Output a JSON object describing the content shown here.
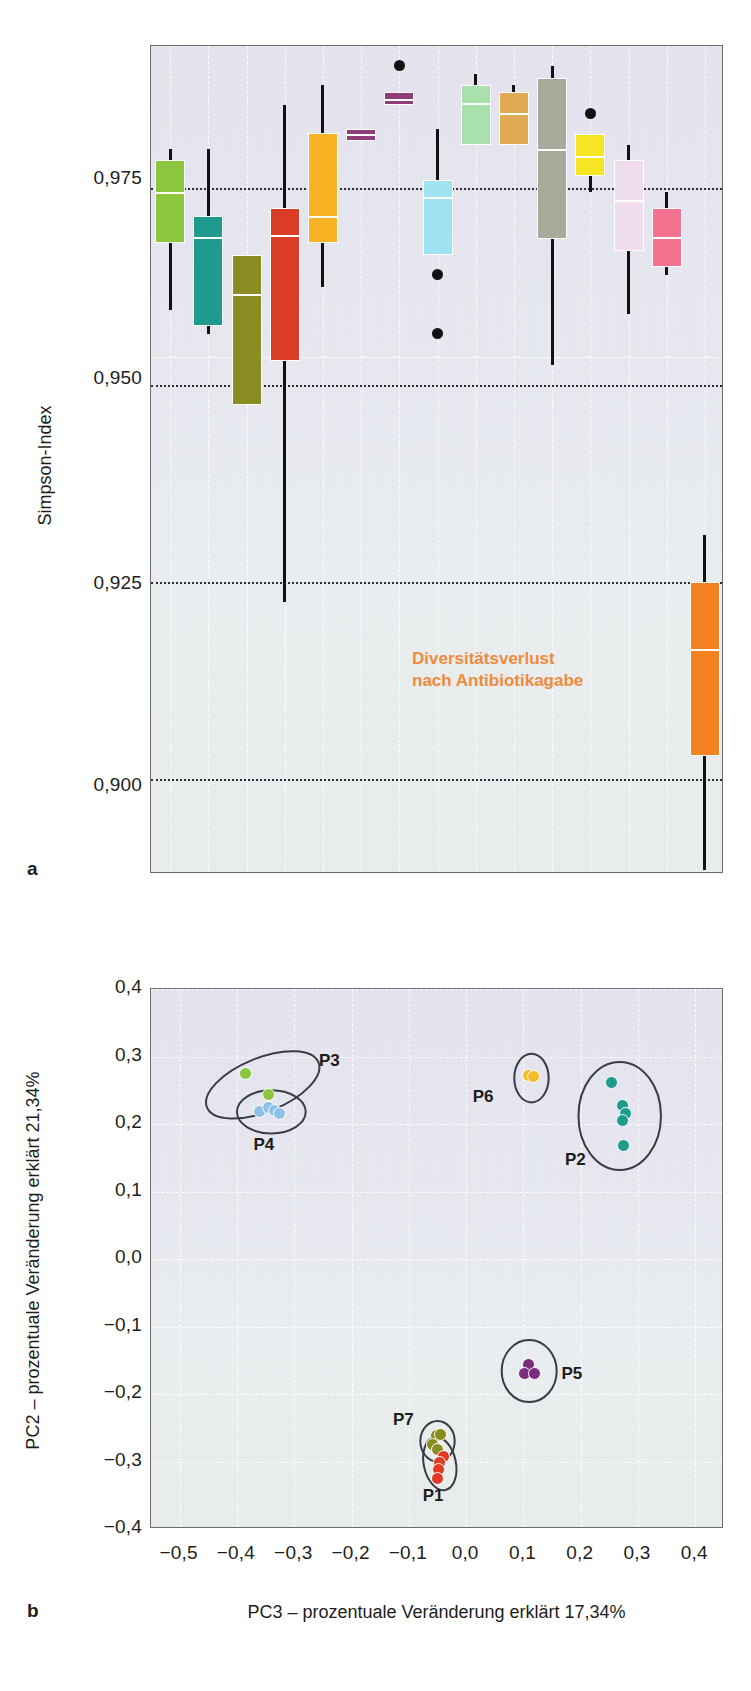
{
  "figure": {
    "panels": [
      {
        "letter": "a"
      },
      {
        "letter": "b"
      }
    ]
  },
  "panel_a": {
    "letter": "a",
    "y_axis_title": "Simpson-Index",
    "y_ticks": [
      "0,975",
      "0,950",
      "0,925",
      "0,900"
    ],
    "annotation_line1": "Diversitätsverlust",
    "annotation_line2": "nach Antibiotikagabe",
    "annotation_color": "#f08a3c"
  },
  "panel_b": {
    "letter": "b",
    "y_axis_title": "PC2 – prozentuale Veränderung erklärt 21,34%",
    "x_axis_title": "PC3 – prozentuale Veränderung erklärt 17,34%",
    "y_ticks": [
      "0,4",
      "0,3",
      "0,2",
      "0,1",
      "0,0",
      "-0,1",
      "-0,2",
      "-0,3",
      "-0,4"
    ],
    "x_ticks": [
      "-0,5",
      "-0,4",
      "-0,3",
      "-0,2",
      "-0,1",
      "0,0",
      "0,1",
      "0,2",
      "0,3",
      "0,4"
    ],
    "cluster_labels": [
      "P3",
      "P4",
      "P6",
      "P2",
      "P5",
      "P7",
      "P1"
    ]
  },
  "chart_data": [
    {
      "type": "box",
      "id": "panel-a",
      "title": "",
      "xlabel": "",
      "ylabel": "Simpson-Index",
      "ylim": [
        0.888,
        0.993
      ],
      "ytick_values": [
        0.975,
        0.95,
        0.925,
        0.9
      ],
      "ytick_labels": [
        "0,975",
        "0,950",
        "0,925",
        "0,900"
      ],
      "grid": "dotted-horizontal-at-ticks",
      "legend": "none",
      "annotations": [
        {
          "text": "Diversitätsverlust nach Antibiotikagabe",
          "color": "#f08a3c",
          "points_to": "orange-box"
        }
      ],
      "boxes": [
        {
          "name": "box-1",
          "color": "#8cc63e",
          "whisker_low": 0.9595,
          "q1": 0.968,
          "median": 0.9745,
          "q3": 0.9785,
          "whisker_high": 0.98
        },
        {
          "name": "box-2",
          "color": "#1f9a8e",
          "whisker_low": 0.9565,
          "q1": 0.9575,
          "median": 0.9688,
          "q3": 0.9715,
          "whisker_high": 0.98
        },
        {
          "name": "box-3",
          "color": "#8a8d22",
          "whisker_low": 0.9475,
          "q1": 0.9475,
          "median": 0.9615,
          "q3": 0.9665,
          "whisker_high": 0.9665
        },
        {
          "name": "box-4",
          "color": "#da3c25",
          "whisker_low": 0.9225,
          "q1": 0.953,
          "median": 0.969,
          "q3": 0.9725,
          "whisker_high": 0.9855
        },
        {
          "name": "box-5",
          "color": "#f9b325",
          "whisker_low": 0.9625,
          "q1": 0.968,
          "median": 0.9715,
          "q3": 0.982,
          "whisker_high": 0.988
        },
        {
          "name": "box-6",
          "color": "#8e3d76",
          "whisker_low": 0.981,
          "q1": 0.981,
          "median": 0.9818,
          "q3": 0.9825,
          "whisker_high": 0.9825
        },
        {
          "name": "box-7",
          "color": "#8e3d76",
          "whisker_low": 0.9855,
          "q1": 0.9855,
          "median": 0.9863,
          "q3": 0.9872,
          "whisker_high": 0.9872,
          "outlier": 0.9905
        },
        {
          "name": "box-8",
          "color": "#9fe3f2",
          "whisker_low": 0.9665,
          "q1": 0.9665,
          "median": 0.9738,
          "q3": 0.976,
          "whisker_high": 0.9825,
          "outliers": [
            0.9565,
            0.964
          ]
        },
        {
          "name": "box-9",
          "color": "#a9e0ab",
          "whisker_low": 0.9805,
          "q1": 0.9805,
          "median": 0.9858,
          "q3": 0.988,
          "whisker_high": 0.9895
        },
        {
          "name": "box-10",
          "color": "#e0aa53",
          "whisker_low": 0.9805,
          "q1": 0.9805,
          "median": 0.9845,
          "q3": 0.9872,
          "whisker_high": 0.988
        },
        {
          "name": "box-11",
          "color": "#a8a89b",
          "whisker_low": 0.9525,
          "q1": 0.9685,
          "median": 0.98,
          "q3": 0.989,
          "whisker_high": 0.9905
        },
        {
          "name": "box-12",
          "color": "#f7e524",
          "whisker_low": 0.9745,
          "q1": 0.9765,
          "median": 0.979,
          "q3": 0.9818,
          "whisker_high": 0.9818,
          "outlier": 0.9845
        },
        {
          "name": "box-13",
          "color": "#f0dcec",
          "whisker_low": 0.959,
          "q1": 0.967,
          "median": 0.9735,
          "q3": 0.9785,
          "whisker_high": 0.9805
        },
        {
          "name": "box-14",
          "color": "#f4728f",
          "whisker_low": 0.964,
          "q1": 0.965,
          "median": 0.9688,
          "q3": 0.9725,
          "whisker_high": 0.9745
        },
        {
          "name": "box-orange",
          "color": "#f58220",
          "whisker_low": 0.8885,
          "q1": 0.903,
          "median": 0.9165,
          "q3": 0.925,
          "whisker_high": 0.931
        }
      ]
    },
    {
      "type": "scatter",
      "id": "panel-b",
      "title": "",
      "xlabel": "PC3 – prozentuale Veränderung erklärt 17,34%",
      "ylabel": "PC2 – prozentuale Veränderung erklärt 21,34%",
      "xlim": [
        -0.55,
        0.45
      ],
      "ylim": [
        -0.4,
        0.4
      ],
      "xtick_values": [
        -0.5,
        -0.4,
        -0.3,
        -0.2,
        -0.1,
        0.0,
        0.1,
        0.2,
        0.3,
        0.4
      ],
      "xtick_labels": [
        "-0,5",
        "-0,4",
        "-0,3",
        "-0,2",
        "-0,1",
        "0,0",
        "0,1",
        "0,2",
        "0,3",
        "0,4"
      ],
      "ytick_values": [
        0.4,
        0.3,
        0.2,
        0.1,
        0.0,
        -0.1,
        -0.2,
        -0.3,
        -0.4
      ],
      "ytick_labels": [
        "0,4",
        "0,3",
        "0,2",
        "0,1",
        "0,0",
        "-0,1",
        "-0,2",
        "-0,3",
        "-0,4"
      ],
      "grid": "dashed-white",
      "legend": "inline-cluster-labels",
      "series": [
        {
          "name": "P3",
          "color": "#8cc63e",
          "points": [
            [
              -0.385,
              0.275
            ],
            [
              -0.345,
              0.243
            ]
          ]
        },
        {
          "name": "P4",
          "color": "#8fc0e8",
          "points": [
            [
              -0.36,
              0.218
            ],
            [
              -0.345,
              0.224
            ],
            [
              -0.335,
              0.22
            ],
            [
              -0.325,
              0.215
            ]
          ]
        },
        {
          "name": "P6",
          "color": "#f5bc28",
          "points": [
            [
              0.108,
              0.272
            ],
            [
              0.117,
              0.27
            ]
          ]
        },
        {
          "name": "P2",
          "color": "#1f9a8e",
          "points": [
            [
              0.253,
              0.262
            ],
            [
              0.272,
              0.228
            ],
            [
              0.278,
              0.215
            ],
            [
              0.272,
              0.205
            ],
            [
              0.275,
              0.168
            ]
          ]
        },
        {
          "name": "P5",
          "color": "#7b2d7e",
          "points": [
            [
              0.108,
              -0.156
            ],
            [
              0.102,
              -0.17
            ],
            [
              0.12,
              -0.17
            ]
          ]
        },
        {
          "name": "P7",
          "color": "#8a8d22",
          "points": [
            [
              -0.052,
              -0.262
            ],
            [
              -0.044,
              -0.26
            ],
            [
              -0.058,
              -0.275
            ],
            [
              -0.05,
              -0.282
            ]
          ]
        },
        {
          "name": "P1",
          "color": "#e23a26",
          "points": [
            [
              -0.04,
              -0.292
            ],
            [
              -0.046,
              -0.302
            ],
            [
              -0.048,
              -0.312
            ],
            [
              -0.05,
              -0.325
            ]
          ]
        }
      ],
      "ellipses": [
        {
          "name": "P3",
          "cx": -0.355,
          "cy": 0.258,
          "rx": 0.105,
          "ry": 0.04,
          "rotation": -22,
          "label_pos": "right-top"
        },
        {
          "name": "P4",
          "cx": -0.34,
          "cy": 0.218,
          "rx": 0.06,
          "ry": 0.032,
          "rotation": 0,
          "label_pos": "below"
        },
        {
          "name": "P6",
          "cx": 0.114,
          "cy": 0.268,
          "rx": 0.03,
          "ry": 0.036,
          "rotation": 0,
          "label_pos": "left"
        },
        {
          "name": "P2",
          "cx": 0.268,
          "cy": 0.212,
          "rx": 0.072,
          "ry": 0.08,
          "rotation": 0,
          "label_pos": "left-bottom"
        },
        {
          "name": "P5",
          "cx": 0.11,
          "cy": -0.166,
          "rx": 0.048,
          "ry": 0.046,
          "rotation": 0,
          "label_pos": "right"
        },
        {
          "name": "P7",
          "cx": -0.05,
          "cy": -0.27,
          "rx": 0.03,
          "ry": 0.03,
          "rotation": 0,
          "label_pos": "left"
        },
        {
          "name": "P1",
          "cx": -0.046,
          "cy": -0.303,
          "rx": 0.028,
          "ry": 0.04,
          "rotation": -12,
          "label_pos": "below"
        }
      ]
    }
  ]
}
